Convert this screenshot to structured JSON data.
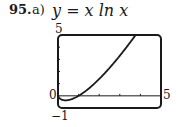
{
  "problem": {
    "number": "95.",
    "part": "a)"
  },
  "chart_data": {
    "type": "line",
    "title": "y = x ln x",
    "function": "x*ln(x)",
    "series": [
      {
        "name": "y = x ln x",
        "x": [
          0.01,
          0.1,
          0.2,
          0.368,
          0.6,
          1,
          1.5,
          2,
          2.5,
          3,
          3.5,
          4,
          4.1
        ],
        "values": [
          -0.046,
          -0.23,
          -0.322,
          -0.368,
          -0.306,
          0,
          0.608,
          1.386,
          2.291,
          3.296,
          4.385,
          5.545,
          5.785
        ]
      }
    ],
    "xlim": [
      0,
      5
    ],
    "ylim": [
      -1,
      5
    ],
    "xticks": [
      1,
      2,
      3,
      4
    ],
    "yticks": [
      1,
      2,
      3,
      4
    ],
    "labels": {
      "xmin": "0",
      "xmax": "5",
      "ymin": "−1",
      "ymax": "5"
    },
    "grid": false
  }
}
